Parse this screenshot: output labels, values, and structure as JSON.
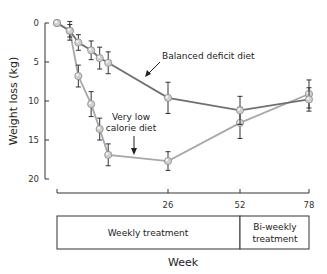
{
  "chart_data": {
    "type": "line",
    "title": "",
    "xlabel": "Week",
    "ylabel": "Weight loss (kg)",
    "ylim": [
      0,
      20
    ],
    "y_inverted": true,
    "yticks": [
      0,
      5,
      10,
      15,
      20
    ],
    "xticks": [
      26,
      52,
      78
    ],
    "xlim": [
      0,
      78
    ],
    "grid": false,
    "series": [
      {
        "name": "Balanced deficit diet",
        "color": "#707070",
        "x": [
          0,
          3,
          5,
          8,
          10,
          12,
          26,
          52,
          78
        ],
        "values": [
          0,
          1.0,
          2.5,
          3.5,
          4.5,
          5.1,
          9.6,
          11.2,
          9.8
        ],
        "errors": [
          0,
          1.2,
          1.0,
          1.2,
          1.4,
          1.4,
          2.0,
          1.8,
          1.5
        ]
      },
      {
        "name": "Very low calorie diet",
        "color": "#a8a8a8",
        "x": [
          0,
          3,
          5,
          8,
          10,
          12,
          26,
          52,
          78
        ],
        "values": [
          0,
          1.0,
          6.8,
          10.4,
          13.6,
          16.9,
          17.7,
          12.8,
          9.1
        ],
        "errors": [
          0,
          0.8,
          1.4,
          1.6,
          1.4,
          1.4,
          1.2,
          2.0,
          1.8
        ]
      }
    ],
    "annotations": [
      {
        "text": "Balanced deficit diet",
        "points_to": "Balanced deficit diet"
      },
      {
        "text_lines": [
          "Very low",
          "calorie diet"
        ],
        "points_to": "Very low calorie diet"
      }
    ],
    "treatment_phases": [
      {
        "label": "Weekly treatment",
        "from_week": 0,
        "to_week": 52
      },
      {
        "label_lines": [
          "Bi-weekly",
          "treatment"
        ],
        "from_week": 52,
        "to_week": 78
      }
    ]
  }
}
